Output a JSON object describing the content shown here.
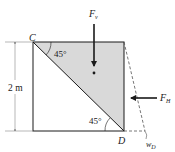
{
  "diagram": {
    "dimension": {
      "label": "2 m"
    },
    "points": {
      "C": "C",
      "D": "D"
    },
    "angles": {
      "top": "45°",
      "bottom": "45°"
    },
    "forces": {
      "vertical": {
        "symbol": "F",
        "subscript": "v"
      },
      "horizontal": {
        "symbol": "F",
        "subscript": "H"
      }
    },
    "displacement": {
      "symbol": "w",
      "subscript": "D"
    },
    "colors": {
      "shade": "#d9d9d9",
      "line": "#1a1a1a",
      "dashed": "#555555"
    }
  }
}
